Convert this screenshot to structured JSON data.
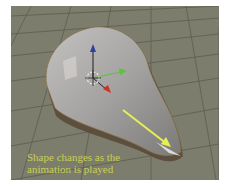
{
  "scene": {
    "description": "3D viewport showing a teardrop-shaped mesh on a grid floor with transform gizmo and yellow direction arrow",
    "colors": {
      "background": "#7d7d6e",
      "grid": "#5a5a4e",
      "mesh": "#a8a6a4",
      "axis_z": "#3040a0",
      "axis_y": "#60c040",
      "axis_x": "#d03020",
      "arrow": "#e6f050",
      "caption": "#c8cf52"
    }
  },
  "caption": {
    "line1": "Shape changes as the",
    "line2": "animation is played"
  }
}
